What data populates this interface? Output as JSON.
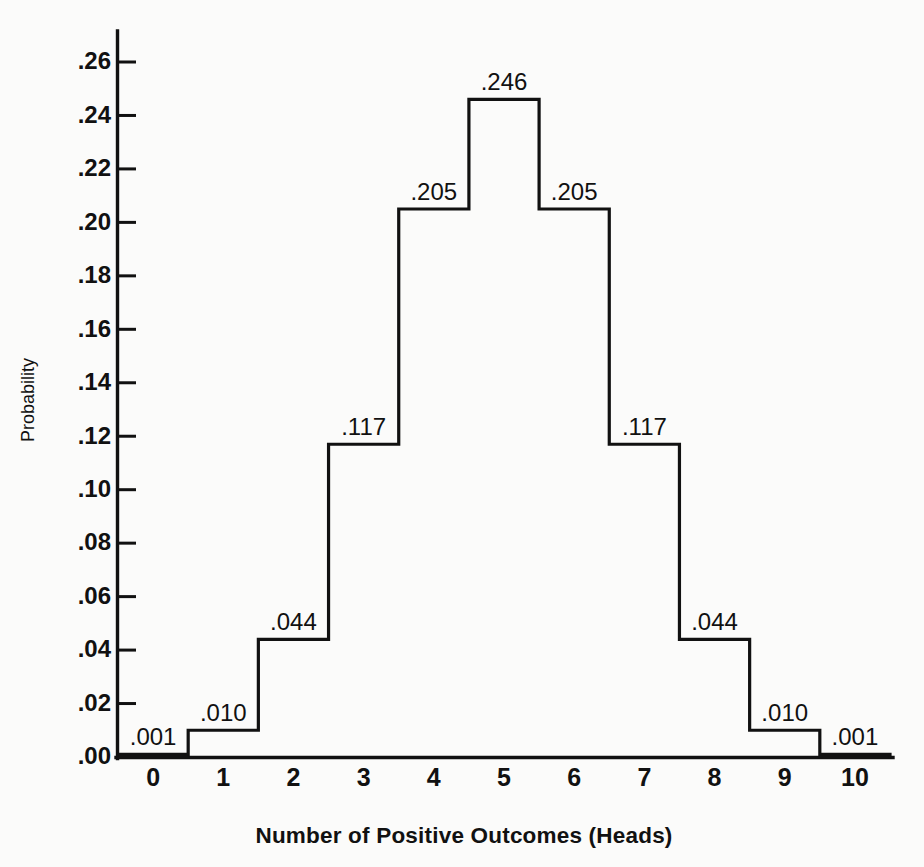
{
  "chart_data": {
    "type": "bar",
    "title": "",
    "subtitle": "",
    "xlabel": "Number of Positive Outcomes (Heads)",
    "ylabel": "Probability",
    "categories": [
      "0",
      "1",
      "2",
      "3",
      "4",
      "5",
      "6",
      "7",
      "8",
      "9",
      "10"
    ],
    "values": [
      0.001,
      0.01,
      0.044,
      0.117,
      0.205,
      0.246,
      0.205,
      0.117,
      0.044,
      0.01,
      0.001
    ],
    "value_labels": [
      ".001",
      ".010",
      ".044",
      ".117",
      ".205",
      ".246",
      ".205",
      ".117",
      ".044",
      ".010",
      ".001"
    ],
    "ylim": [
      0.0,
      0.26
    ],
    "xlim": [
      -0.5,
      10.5
    ],
    "ytick_values": [
      0.0,
      0.02,
      0.04,
      0.06,
      0.08,
      0.1,
      0.12,
      0.14,
      0.16,
      0.18,
      0.2,
      0.22,
      0.24,
      0.26
    ],
    "ytick_labels": [
      ".00",
      ".02",
      ".04",
      ".06",
      ".08",
      ".10",
      ".12",
      ".14",
      ".16",
      ".18",
      ".20",
      ".22",
      ".24",
      ".26"
    ],
    "xtick_labels": [
      "0",
      "1",
      "2",
      "3",
      "4",
      "5",
      "6",
      "7",
      "8",
      "9",
      "10"
    ],
    "grid": false,
    "legend": null,
    "legend_position": "none",
    "annotations": [],
    "series_name": "Probability",
    "bar_style": "outlined-histogram",
    "colors": {
      "background": "#fbfbfa",
      "stroke": "#111111",
      "bar_fill": "none",
      "text": "#111111"
    }
  }
}
